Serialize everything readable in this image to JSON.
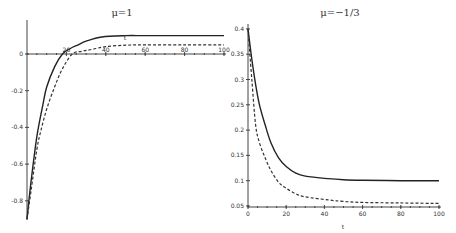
{
  "chart_data": [
    {
      "type": "line",
      "title": "μ=1",
      "xlabel": "t",
      "ylabel": "",
      "xlim": [
        0,
        100
      ],
      "ylim": [
        -0.9,
        0.15
      ],
      "x_ticks": [
        20,
        40,
        60,
        80,
        100
      ],
      "x_tick_labels": [
        "20",
        "40",
        "60",
        "80",
        "100"
      ],
      "y_ticks": [
        0,
        -0.2,
        -0.4,
        -0.6,
        -0.8
      ],
      "y_tick_labels": [
        "0",
        "-0.2",
        "-0.4",
        "-0.6",
        "-0.8"
      ],
      "grid": false,
      "legend": null,
      "series": [
        {
          "name": "solid",
          "style": "solid",
          "x": [
            0,
            2,
            5,
            8,
            10,
            14,
            18,
            22,
            26,
            30,
            38,
            50,
            60,
            80,
            100
          ],
          "values": [
            -0.9,
            -0.7,
            -0.45,
            -0.28,
            -0.18,
            -0.07,
            0.0,
            0.03,
            0.05,
            0.07,
            0.093,
            0.1,
            0.1,
            0.1,
            0.1
          ]
        },
        {
          "name": "dashed",
          "style": "dashed",
          "x": [
            0,
            2,
            5,
            7,
            10,
            14,
            18,
            23,
            28,
            33,
            40,
            50,
            60,
            80,
            100
          ],
          "values": [
            -0.9,
            -0.75,
            -0.52,
            -0.42,
            -0.3,
            -0.18,
            -0.08,
            0.0,
            0.015,
            0.025,
            0.04,
            0.048,
            0.05,
            0.05,
            0.05
          ]
        }
      ]
    },
    {
      "type": "line",
      "title": "μ=−1/3",
      "xlabel": "t",
      "ylabel": "",
      "xlim": [
        0,
        100
      ],
      "ylim": [
        0.05,
        0.4
      ],
      "x_ticks": [
        0,
        20,
        40,
        60,
        80,
        100
      ],
      "x_tick_labels": [
        "0",
        "20",
        "40",
        "60",
        "80",
        "100"
      ],
      "y_ticks": [
        0.4,
        0.35,
        0.3,
        0.25,
        0.2,
        0.15,
        0.1,
        0.05
      ],
      "y_tick_labels": [
        "0.4",
        "0.35",
        "0.3",
        "0.25",
        "0.2",
        "0.15",
        "0.1",
        "0.05"
      ],
      "grid": false,
      "legend": null,
      "series": [
        {
          "name": "solid",
          "style": "solid",
          "x": [
            0,
            2,
            4,
            6,
            9,
            12,
            16,
            20,
            25,
            30,
            42,
            50,
            60,
            80,
            100
          ],
          "values": [
            0.4,
            0.34,
            0.29,
            0.25,
            0.21,
            0.175,
            0.145,
            0.128,
            0.115,
            0.109,
            0.104,
            0.102,
            0.101,
            0.1,
            0.1
          ]
        },
        {
          "name": "dashed",
          "style": "dashed",
          "x": [
            0,
            2,
            4,
            6,
            9,
            12,
            16,
            20,
            25,
            30,
            42,
            50,
            60,
            80,
            100
          ],
          "values": [
            0.4,
            0.3,
            0.21,
            0.175,
            0.145,
            0.12,
            0.097,
            0.085,
            0.074,
            0.068,
            0.062,
            0.059,
            0.057,
            0.056,
            0.055
          ]
        }
      ]
    }
  ]
}
